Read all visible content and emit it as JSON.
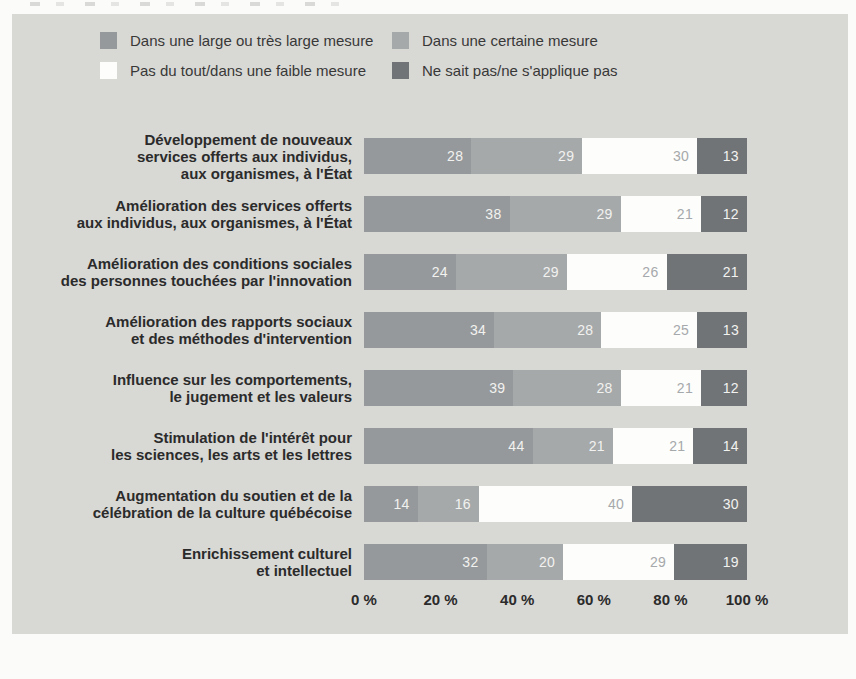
{
  "panel": {
    "background": "#d8d8d5"
  },
  "legend": {
    "items": [
      {
        "id": "large-mesure",
        "label": "Dans une large ou très large mesure",
        "color": "#96999b"
      },
      {
        "id": "certaine-mesure",
        "label": "Dans une certaine mesure",
        "color": "#a6a9aa"
      },
      {
        "id": "faible-mesure",
        "label": "Pas du tout/dans une faible mesure",
        "color": "#fdfdfb"
      },
      {
        "id": "ne-sait-pas",
        "label": "Ne sait pas/ne s'applique pas",
        "color": "#717476"
      }
    ],
    "columns": [
      [
        0,
        2
      ],
      [
        1,
        3
      ]
    ]
  },
  "chart_data": {
    "type": "bar",
    "orientation": "horizontal",
    "stacked": true,
    "unit": "%",
    "grid": false,
    "legend_position": "top",
    "categories": [
      "Développement de nouveaux services offerts aux individus, aux organismes, à l'État",
      "Amélioration des services offerts aux individus, aux organismes, à l'État",
      "Amélioration des conditions sociales des personnes touchées par l'innovation",
      "Amélioration des rapports sociaux et des méthodes d'intervention",
      "Influence sur les comportements, le jugement et les valeurs",
      "Stimulation de l'intérêt pour les sciences, les arts et les lettres",
      "Augmentation du soutien et de la célébration de la culture québécoise",
      "Enrichissement culturel et intellectuel"
    ],
    "category_label_lines": [
      [
        "Développement de nouveaux",
        "services offerts aux individus,",
        "aux organismes, à l'État"
      ],
      [
        "Amélioration des services offerts",
        "aux individus, aux organismes, à l'État"
      ],
      [
        "Amélioration des conditions sociales",
        "des personnes touchées par l'innovation"
      ],
      [
        "Amélioration des rapports sociaux",
        "et des méthodes d'intervention"
      ],
      [
        "Influence sur les comportements,",
        "le jugement et les valeurs"
      ],
      [
        "Stimulation de l'intérêt pour",
        "les sciences, les arts et les lettres"
      ],
      [
        "Augmentation du soutien et de la",
        "célébration de la culture québécoise"
      ],
      [
        "Enrichissement culturel",
        "et intellectuel"
      ]
    ],
    "series": [
      {
        "name": "Dans une large ou très large mesure",
        "color": "#96999b",
        "value_text_color": "#f2f2f0",
        "values": [
          28,
          38,
          24,
          34,
          39,
          44,
          14,
          32
        ]
      },
      {
        "name": "Dans une certaine mesure",
        "color": "#a6a9aa",
        "value_text_color": "#f2f2f0",
        "values": [
          29,
          29,
          29,
          28,
          28,
          21,
          16,
          20
        ]
      },
      {
        "name": "Pas du tout/dans une faible mesure",
        "color": "#fdfdfb",
        "value_text_color": "#a6a9ab",
        "values": [
          30,
          21,
          26,
          25,
          21,
          21,
          40,
          29
        ]
      },
      {
        "name": "Ne sait pas/ne s'applique pas",
        "color": "#717476",
        "value_text_color": "#f2f2f0",
        "values": [
          13,
          12,
          21,
          13,
          12,
          14,
          30,
          19
        ]
      }
    ],
    "x_axis": {
      "ticks": [
        "0 %",
        "20 %",
        "40 %",
        "60 %",
        "80 %",
        "100 %"
      ],
      "range": [
        0,
        100
      ]
    }
  }
}
